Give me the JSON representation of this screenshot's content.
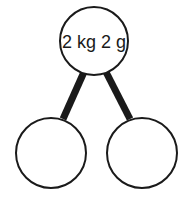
{
  "diagram": {
    "type": "number-bond",
    "whole": {
      "label": "2 kg 2 g"
    },
    "parts": [
      {
        "label": ""
      },
      {
        "label": ""
      }
    ],
    "colors": {
      "stroke": "#1a1a1a",
      "fill": "#ffffff"
    }
  }
}
